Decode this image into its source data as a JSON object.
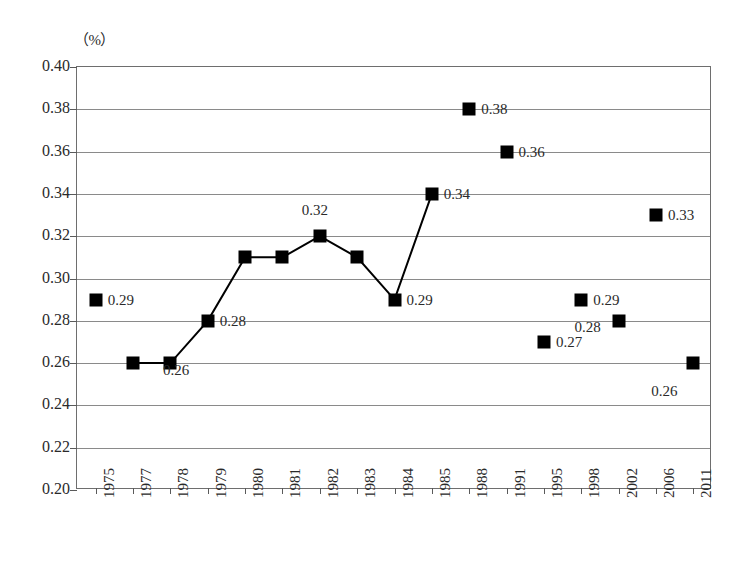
{
  "chart_data": {
    "type": "line",
    "title": "",
    "subtitle": "",
    "xlabel": "",
    "ylabel": "",
    "unit_label": "（%）",
    "ylim": [
      0.2,
      0.4
    ],
    "ytick_step": 0.02,
    "yticks": [
      "0.40",
      "0.38",
      "0.36",
      "0.34",
      "0.32",
      "0.30",
      "0.28",
      "0.26",
      "0.24",
      "0.22",
      "0.20"
    ],
    "ytick_values": [
      0.4,
      0.38,
      0.36,
      0.34,
      0.32,
      0.3,
      0.28,
      0.26,
      0.24,
      0.22,
      0.2
    ],
    "grid": true,
    "grid_axis": "y",
    "legend": "none",
    "categories": [
      "1975",
      "1977",
      "1978",
      "1979",
      "1980",
      "1981",
      "1982",
      "1983",
      "1984",
      "1985",
      "1988",
      "1991",
      "1995",
      "1998",
      "2002",
      "2006",
      "2011"
    ],
    "values": [
      0.29,
      0.26,
      0.26,
      0.28,
      0.31,
      0.31,
      0.32,
      0.31,
      0.29,
      0.34,
      0.38,
      0.36,
      0.27,
      0.29,
      0.28,
      0.33,
      0.26
    ],
    "point_labels": [
      "0.29",
      "0.26",
      "",
      "0.28",
      "",
      "",
      "0.32",
      "",
      "0.29",
      "0.34",
      "0.38",
      "0.36",
      "0.27",
      "0.29",
      "0.28",
      "0.33",
      "0.26"
    ],
    "connected_range": [
      1,
      9
    ],
    "marker": "filled-square",
    "marker_color": "#000000",
    "line_color": "#000000",
    "points": [
      {
        "year": "1975",
        "value": 0.29,
        "label": "0.29",
        "label_pos": "right"
      },
      {
        "year": "1977",
        "value": 0.26,
        "label": "0.26",
        "label_pos": "right-offset"
      },
      {
        "year": "1978",
        "value": 0.26,
        "label": "",
        "label_pos": "none"
      },
      {
        "year": "1979",
        "value": 0.28,
        "label": "0.28",
        "label_pos": "right"
      },
      {
        "year": "1980",
        "value": 0.31,
        "label": "",
        "label_pos": "none"
      },
      {
        "year": "1981",
        "value": 0.31,
        "label": "",
        "label_pos": "none"
      },
      {
        "year": "1982",
        "value": 0.32,
        "label": "0.32",
        "label_pos": "above"
      },
      {
        "year": "1983",
        "value": 0.31,
        "label": "",
        "label_pos": "none"
      },
      {
        "year": "1984",
        "value": 0.29,
        "label": "0.29",
        "label_pos": "right"
      },
      {
        "year": "1985",
        "value": 0.34,
        "label": "0.34",
        "label_pos": "right"
      },
      {
        "year": "1988",
        "value": 0.38,
        "label": "0.38",
        "label_pos": "right"
      },
      {
        "year": "1991",
        "value": 0.36,
        "label": "0.36",
        "label_pos": "right"
      },
      {
        "year": "1995",
        "value": 0.27,
        "label": "0.27",
        "label_pos": "right"
      },
      {
        "year": "1998",
        "value": 0.29,
        "label": "0.29",
        "label_pos": "right"
      },
      {
        "year": "2002",
        "value": 0.28,
        "label": "0.28",
        "label_pos": "left"
      },
      {
        "year": "2006",
        "value": 0.33,
        "label": "0.33",
        "label_pos": "right"
      },
      {
        "year": "2011",
        "value": 0.26,
        "label": "0.26",
        "label_pos": "below-left"
      }
    ]
  },
  "footer": {
    "caption_clipped": ""
  }
}
